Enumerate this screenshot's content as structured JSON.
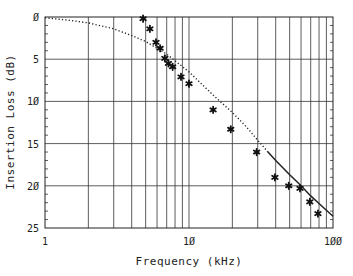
{
  "chart_data": {
    "type": "line",
    "title": "",
    "xlabel": "Frequency (kHz)",
    "ylabel": "Insertion Loss (dB)",
    "xscale": "log",
    "xlim": [
      1,
      100
    ],
    "ylim": [
      0,
      25
    ],
    "y_inverted": true,
    "grid": true,
    "x_ticks": [
      1,
      10,
      100
    ],
    "x_tick_labels": [
      "1",
      "10",
      "100"
    ],
    "y_ticks": [
      0,
      5,
      10,
      15,
      20,
      25
    ],
    "y_tick_labels": [
      "0",
      "5",
      "10",
      "15",
      "20",
      "25"
    ],
    "series": [
      {
        "name": "Model (dotted)",
        "style": "dotted",
        "x": [
          1,
          1.5,
          2,
          3,
          4,
          5,
          7,
          10,
          15,
          20,
          25,
          30,
          35
        ],
        "y": [
          0.1,
          0.4,
          0.7,
          1.4,
          2.2,
          2.9,
          4.4,
          6.5,
          9.4,
          11.3,
          13.0,
          14.6,
          15.9
        ]
      },
      {
        "name": "Model (solid)",
        "style": "solid",
        "x": [
          35,
          40,
          50,
          60,
          70,
          80,
          90,
          100
        ],
        "y": [
          15.9,
          17.0,
          18.7,
          20.0,
          21.2,
          22.1,
          22.9,
          23.6
        ]
      },
      {
        "name": "Measured",
        "style": "marker-star",
        "x": [
          4.8,
          5.35,
          5.9,
          6.3,
          6.8,
          7.2,
          7.7,
          8.8,
          10,
          14.7,
          19.5,
          29.5,
          39.5,
          49.3,
          59,
          69,
          78.6
        ],
        "y": [
          0.2,
          1.4,
          3.0,
          3.7,
          4.9,
          5.5,
          5.9,
          7.1,
          7.9,
          11.0,
          13.3,
          16.0,
          19.0,
          20.0,
          20.3,
          21.9,
          23.3
        ]
      }
    ]
  },
  "colors": {
    "ink": "#222222",
    "grid": "#333333",
    "background": "#ffffff"
  }
}
